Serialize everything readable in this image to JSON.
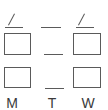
{
  "diagram": {
    "stroke_color": "#5a5a5a",
    "label_color": "#3a3a3a",
    "columns": [
      {
        "day": "M",
        "top_mark": "slash",
        "top_line": true,
        "upper_box": true,
        "lower_box": true
      },
      {
        "day": "T",
        "top_mark": "none",
        "top_line": true,
        "upper_box": false,
        "middle_line": true,
        "lower_box": false,
        "lower_line": true
      },
      {
        "day": "W",
        "top_mark": "slash",
        "top_line": true,
        "upper_box": true,
        "lower_box": true
      }
    ]
  },
  "labels": {
    "monday": "M",
    "tuesday": "T",
    "wednesday": "W"
  }
}
